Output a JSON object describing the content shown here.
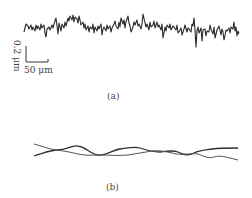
{
  "figure": {
    "panel_a": {
      "caption": "(a)",
      "description": "rough surface profile trace",
      "scale_bar": {
        "vertical_label": "0.2 μm",
        "horizontal_label": "50 μm"
      },
      "trace_color": "#2a2a2a"
    },
    "panel_b": {
      "caption": "(b)",
      "description": "two smoothed profile curves crossing each other",
      "curve_colors": [
        "#333333",
        "#555555"
      ]
    }
  }
}
